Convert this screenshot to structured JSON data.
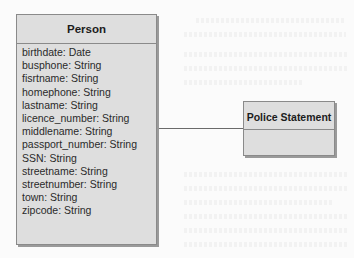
{
  "diagram": {
    "type": "uml-class-diagram",
    "classes": [
      {
        "name": "Person",
        "attributes": [
          "birthdate:  Date",
          "busphone:  String",
          "fisrtname:  String",
          "homephone:  String",
          "lastname:  String",
          "licence_number:  String",
          "middlename:  String",
          "passport_number:  String",
          "SSN:  String",
          "streetname:  String",
          "streetnumber:  String",
          "town:  String",
          "zipcode:  String"
        ]
      },
      {
        "name": "Police Statement",
        "attributes": []
      }
    ],
    "associations": [
      {
        "from": "Person",
        "to": "Police Statement",
        "label": ""
      }
    ]
  },
  "colors": {
    "box_fill": "#dedede",
    "box_border": "#8a8a8a",
    "shadow": "#9a9a9a",
    "line": "#6a6a6a",
    "background": "#fbfbfb"
  }
}
